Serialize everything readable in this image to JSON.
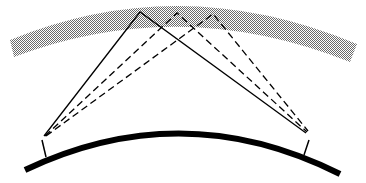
{
  "diagram": {
    "colors": {
      "layer": "#b3b3b3",
      "ground": "#000000",
      "rays": "#000000",
      "background": "#ffffff"
    },
    "layer": {
      "label": ""
    },
    "ground": {
      "label": ""
    },
    "stations": [
      {
        "id": "left",
        "x": 43,
        "y": 140
      },
      {
        "id": "right",
        "x": 304,
        "y": 135
      }
    ],
    "reflection_points": [
      {
        "x": 140,
        "y": 12,
        "style": "solid"
      },
      {
        "x": 177,
        "y": 13,
        "style": "dashed"
      },
      {
        "x": 213,
        "y": 14,
        "style": "dashed"
      }
    ]
  }
}
